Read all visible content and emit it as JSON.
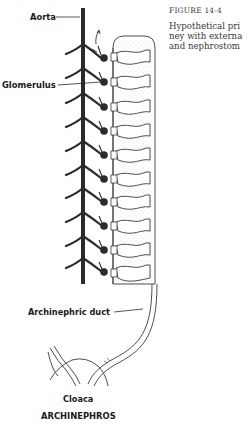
{
  "figure": {
    "number": "FIGURE 14-4",
    "caption_lines": [
      "Hypothetical pri",
      "ney with externa",
      "and nephrostom"
    ]
  },
  "labels": {
    "aorta": "Aorta",
    "glomerulus": "Glomerulus",
    "archinephric_duct": "Archinephric duct",
    "cloaca": "Cloaca",
    "title": "ARCHINEPHROS"
  },
  "diagram": {
    "segment_count": 10,
    "colors": {
      "ink": "#2b2b2b",
      "stipple": "#bdbdbd",
      "background": "#ffffff"
    }
  }
}
